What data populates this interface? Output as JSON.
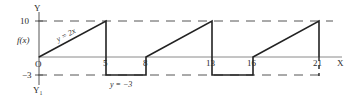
{
  "diagram": {
    "title": "",
    "axes": {
      "y_label": "Y",
      "y_prime_label": "Y₁",
      "x_label": "X",
      "origin_label": "O",
      "function_label": "f(x)"
    },
    "y_ticks": [
      {
        "value": 10,
        "label": "10"
      },
      {
        "value": -3,
        "label": "−3"
      }
    ],
    "x_ticks": [
      {
        "value": 5,
        "label": "5"
      },
      {
        "value": 8,
        "label": "8"
      },
      {
        "value": 13,
        "label": "13"
      },
      {
        "value": 16,
        "label": "16"
      },
      {
        "value": 21,
        "label": "21"
      }
    ],
    "annotations": {
      "ramp": "y = 2x",
      "flat": "y = −3"
    },
    "segments": [
      {
        "type": "ramp",
        "from": [
          0,
          0
        ],
        "to": [
          5,
          10
        ]
      },
      {
        "type": "drop",
        "from": [
          5,
          10
        ],
        "to": [
          5,
          -3
        ]
      },
      {
        "type": "flat",
        "from": [
          5,
          -3
        ],
        "to": [
          8,
          -3
        ]
      },
      {
        "type": "rise",
        "from": [
          8,
          -3
        ],
        "to": [
          8,
          0
        ]
      },
      {
        "type": "ramp",
        "from": [
          8,
          0
        ],
        "to": [
          13,
          10
        ]
      },
      {
        "type": "drop",
        "from": [
          13,
          10
        ],
        "to": [
          13,
          -3
        ]
      },
      {
        "type": "flat",
        "from": [
          13,
          -3
        ],
        "to": [
          16,
          -3
        ]
      },
      {
        "type": "rise",
        "from": [
          16,
          -3
        ],
        "to": [
          16,
          0
        ]
      },
      {
        "type": "ramp",
        "from": [
          16,
          0
        ],
        "to": [
          21,
          10
        ]
      },
      {
        "type": "drop",
        "from": [
          21,
          10
        ],
        "to": [
          21,
          0
        ]
      }
    ]
  }
}
